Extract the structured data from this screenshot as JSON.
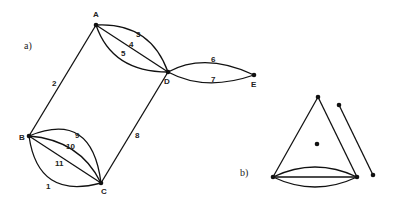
{
  "part_a": {
    "label": "a)",
    "vertices": [
      {
        "id": "A",
        "x": 96,
        "y": 25,
        "lx": 93,
        "ly": 17
      },
      {
        "id": "D",
        "x": 168,
        "y": 72,
        "lx": 164,
        "ly": 84
      },
      {
        "id": "E",
        "x": 254,
        "y": 75,
        "lx": 251,
        "ly": 87
      },
      {
        "id": "B",
        "x": 29,
        "y": 136,
        "lx": 19,
        "ly": 140
      },
      {
        "id": "C",
        "x": 101,
        "y": 183,
        "lx": 101,
        "ly": 194
      }
    ],
    "edges": [
      {
        "id": "1",
        "from": "B",
        "to": "C",
        "label": "1",
        "lx": 46,
        "ly": 186
      },
      {
        "id": "2",
        "from": "A",
        "to": "B",
        "label": "2",
        "lx": 52,
        "ly": 86
      },
      {
        "id": "3",
        "from": "A",
        "to": "D",
        "label": "3",
        "lx": 136,
        "ly": 37
      },
      {
        "id": "4",
        "from": "A",
        "to": "D",
        "label": "4",
        "lx": 129,
        "ly": 47
      },
      {
        "id": "5",
        "from": "A",
        "to": "D",
        "label": "5",
        "lx": 121,
        "ly": 56
      },
      {
        "id": "6",
        "from": "D",
        "to": "E",
        "label": "6",
        "lx": 212,
        "ly": 63
      },
      {
        "id": "7",
        "from": "D",
        "to": "E",
        "label": "7",
        "lx": 212,
        "ly": 83
      },
      {
        "id": "8",
        "from": "D",
        "to": "C",
        "label": "8",
        "lx": 135,
        "ly": 138
      },
      {
        "id": "9",
        "from": "B",
        "to": "C",
        "label": "9",
        "lx": 75,
        "ly": 138
      },
      {
        "id": "10",
        "from": "B",
        "to": "C",
        "label": "10",
        "lx": 67,
        "ly": 149
      },
      {
        "id": "11",
        "from": "B",
        "to": "C",
        "label": "11",
        "lx": 55,
        "ly": 166
      }
    ]
  },
  "part_b": {
    "label": "b)"
  }
}
